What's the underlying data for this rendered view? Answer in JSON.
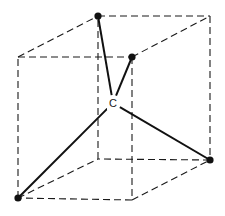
{
  "diagram": {
    "center_atom": {
      "label": "C",
      "x": 113,
      "y": 103
    },
    "cube": {
      "front_top_left": [
        18,
        57
      ],
      "front_top_right": [
        132,
        57
      ],
      "front_bottom_left": [
        18,
        198
      ],
      "front_bottom_right": [
        132,
        200
      ],
      "back_top_left": [
        98,
        16
      ],
      "back_top_right": [
        210,
        16
      ],
      "back_bottom_left": [
        98,
        159
      ],
      "back_bottom_right": [
        210,
        160
      ]
    },
    "substituents": [
      {
        "name": "top-back-left",
        "x": 98,
        "y": 16
      },
      {
        "name": "top-front-right",
        "x": 132,
        "y": 57
      },
      {
        "name": "bottom-front-left",
        "x": 18,
        "y": 198
      },
      {
        "name": "bottom-back-right",
        "x": 210,
        "y": 160
      }
    ],
    "colors": {
      "line": "#111111",
      "background": "#ffffff"
    }
  }
}
